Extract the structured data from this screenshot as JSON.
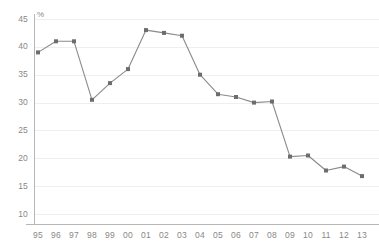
{
  "chart_data": {
    "type": "line",
    "title": "",
    "subtitle": "",
    "xlabel": "",
    "ylabel": "%",
    "unit_label": "%",
    "grid": true,
    "legend": "none",
    "categories": [
      "95",
      "96",
      "97",
      "98",
      "99",
      "00",
      "01",
      "02",
      "03",
      "04",
      "05",
      "06",
      "07",
      "08",
      "09",
      "10",
      "11",
      "12",
      "13"
    ],
    "values": [
      39,
      41,
      41,
      30.5,
      33.5,
      36,
      43,
      42.5,
      42,
      35,
      31.5,
      31,
      30,
      30.2,
      20.3,
      20.5,
      17.8,
      18.5,
      16.8
    ],
    "ylim": [
      10,
      45
    ],
    "yticks": [
      45,
      40,
      35,
      30,
      25,
      20,
      15,
      10
    ],
    "series": [
      {
        "name": "series-1",
        "values": [
          39,
          41,
          41,
          30.5,
          33.5,
          36,
          43,
          42.5,
          42,
          35,
          31.5,
          31,
          30,
          30.2,
          20.3,
          20.5,
          17.8,
          18.5,
          16.8
        ]
      }
    ],
    "colors": {
      "line": "#8c8a89",
      "marker": "#6f6d6c",
      "grid": "#f0eeee",
      "axis": "#b9b7b6",
      "tick_text": "#8a8785",
      "background": "#ffffff"
    }
  }
}
